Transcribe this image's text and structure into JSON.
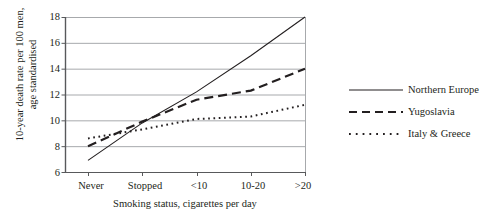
{
  "chart_data": {
    "type": "line",
    "title": "",
    "xlabel": "Smoking status, cigarettes per day",
    "ylabel": "10-year death rate per 100 men,\nage standardised",
    "categories": [
      "Never",
      "Stopped",
      "<10",
      "10-20",
      ">20"
    ],
    "ylim": [
      6,
      18
    ],
    "yticks": [
      6,
      8,
      10,
      12,
      14,
      16,
      18
    ],
    "grid": true,
    "legend_position": "right",
    "series": [
      {
        "name": "Northern Europe",
        "style": "solid",
        "color": "#231f20",
        "values": [
          6.9,
          9.8,
          12.2,
          15.0,
          18.0
        ]
      },
      {
        "name": "Yugoslavia",
        "style": "dashed",
        "color": "#231f20",
        "values": [
          8.0,
          9.9,
          11.6,
          12.3,
          14.0
        ]
      },
      {
        "name": "Italy & Greece",
        "style": "dotted",
        "color": "#231f20",
        "values": [
          8.6,
          9.3,
          10.1,
          10.3,
          11.2
        ]
      }
    ]
  },
  "axis": {
    "ytick_labels": [
      "18",
      "16",
      "14",
      "12",
      "10",
      "8",
      "6"
    ],
    "xtick_labels": [
      "Never",
      "Stopped",
      "<10",
      "10-20",
      ">20"
    ]
  },
  "legend": {
    "items": [
      {
        "label": "Northern Europe"
      },
      {
        "label": "Yugoslavia"
      },
      {
        "label": "Italy & Greece"
      }
    ]
  }
}
